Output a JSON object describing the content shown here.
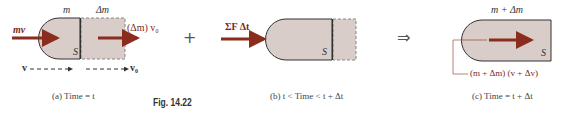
{
  "figure": {
    "number_label": "Fig. 14.22",
    "colors": {
      "body_fill": "#d9cdca",
      "outline": "#333333",
      "dashed_outline": "#888888",
      "arrow": "#8b2d1c",
      "text": "#333333"
    }
  },
  "panel_a": {
    "mass_label": "m",
    "delta_mass_label": "Δm",
    "momentum_in_label": "mv",
    "momentum_out_label": "(Δm) v₀",
    "system_label": "S",
    "velocity_label": "v",
    "velocity0_label": "v₀",
    "caption": "(a)  Time = t"
  },
  "operator_plus": "+",
  "panel_b": {
    "impulse_label": "ΣF Δt",
    "system_label": "S",
    "caption": "(b)  t < Time < t + Δt"
  },
  "operator_implies": "⇒",
  "panel_c": {
    "mass_label": "m + Δm",
    "system_label": "S",
    "momentum_label": "(m + Δm) (v + Δv)",
    "caption": "(c)  Time = t + Δt"
  }
}
